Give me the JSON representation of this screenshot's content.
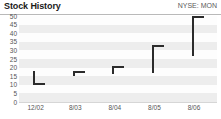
{
  "header": {
    "title": "Stock History",
    "ticker": "NYSE: MON"
  },
  "chart_data": {
    "type": "bar",
    "title": "Stock History",
    "subtitle": "NYSE: MON",
    "xlabel": "",
    "ylabel": "",
    "ylim": [
      0,
      50
    ],
    "yticks": [
      0,
      5,
      10,
      15,
      20,
      25,
      30,
      35,
      40,
      45,
      50
    ],
    "ytick_labels": [
      "0",
      "5",
      "10",
      "15",
      "20",
      "25",
      "30",
      "35",
      "40",
      "45",
      "50"
    ],
    "grid": true,
    "legend": "none",
    "categories": [
      "12/02",
      "8/03",
      "8/04",
      "8/05",
      "8/06"
    ],
    "series": [
      {
        "name": "Price range",
        "low": [
          11,
          15,
          16,
          17,
          27
        ],
        "high": [
          18,
          18,
          21,
          33,
          50
        ],
        "close": [
          11,
          18,
          21,
          33,
          50
        ]
      }
    ],
    "bars": [
      {
        "label": "12/02",
        "low": 11,
        "high": 18,
        "close": 11,
        "tick_side": "bottom"
      },
      {
        "label": "8/03",
        "low": 15,
        "high": 18,
        "close": 18,
        "tick_side": "top"
      },
      {
        "label": "8/04",
        "low": 16,
        "high": 21,
        "close": 21,
        "tick_side": "top"
      },
      {
        "label": "8/05",
        "low": 17,
        "high": 33,
        "close": 33,
        "tick_side": "top"
      },
      {
        "label": "8/06",
        "low": 27,
        "high": 50,
        "close": 50,
        "tick_side": "top"
      }
    ],
    "colors": {
      "mark": "#2b2b2b",
      "band": "#ededed",
      "plot_background": "#fdfdfd",
      "axis_text": "#555555",
      "title_text": "#1a1a1a",
      "rule": "#b9b9b9"
    }
  }
}
